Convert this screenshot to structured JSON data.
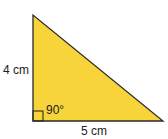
{
  "diagram": {
    "shape": "right triangle",
    "fill_color": "#f6d43a",
    "stroke_color": "#2a2a2a",
    "labels": {
      "vertical_side": "4 cm",
      "horizontal_side": "5 cm",
      "angle": "90°"
    }
  }
}
